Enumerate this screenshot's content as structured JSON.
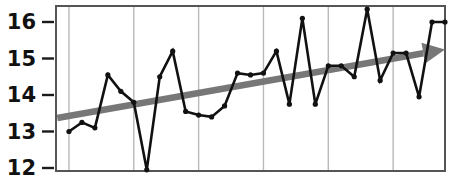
{
  "chart_data": {
    "type": "line",
    "title": "",
    "subtitle": "",
    "xlabel": "",
    "ylabel": "",
    "grid": "vertical",
    "legend": "none",
    "ylim": [
      11.75,
      16.55
    ],
    "yticks": [
      12,
      13,
      14,
      15,
      16
    ],
    "ytick_labels": [
      "12",
      "13",
      "14",
      "15",
      "16"
    ],
    "xlim": [
      0,
      30
    ],
    "xticks": [],
    "xtick_labels": [],
    "x_gridlines": [
      1,
      6,
      11,
      16,
      21,
      26
    ],
    "series": [
      {
        "name": "observations",
        "color": "#111111",
        "marker": "dot",
        "x": [
          1,
          2,
          3,
          4,
          5,
          6,
          7,
          8,
          9,
          10,
          11,
          12,
          13,
          14,
          15,
          16,
          17,
          18,
          19,
          20,
          21,
          22,
          23,
          24,
          25,
          26,
          27,
          28,
          29,
          30
        ],
        "values": [
          13.0,
          13.25,
          13.1,
          14.55,
          14.1,
          13.8,
          11.95,
          14.5,
          15.2,
          13.55,
          13.45,
          13.4,
          13.7,
          14.6,
          14.55,
          14.6,
          15.2,
          13.75,
          16.1,
          13.75,
          14.8,
          14.8,
          14.5,
          16.35,
          14.4,
          15.15,
          15.15,
          13.95,
          16.0,
          16.0
        ]
      }
    ],
    "trend": {
      "name": "trend-arrow",
      "color": "#777777",
      "style": "arrow",
      "x_start": 0.1,
      "y_start": 13.37,
      "x_end": 30.0,
      "y_end": 15.25
    }
  }
}
